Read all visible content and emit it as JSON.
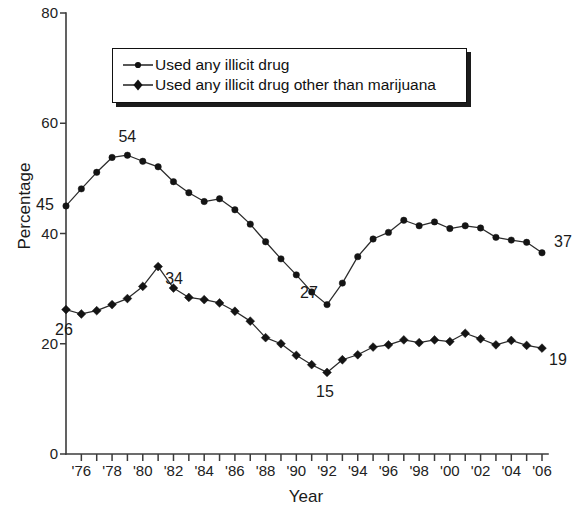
{
  "chart_data": {
    "type": "line",
    "title": "",
    "xlabel": "Year",
    "ylabel": "Percentage",
    "ylim": [
      0,
      80
    ],
    "yticks": [
      0,
      20,
      40,
      60,
      80
    ],
    "xlim": [
      1975,
      2006
    ],
    "xtick_values": [
      1976,
      1978,
      1980,
      1982,
      1984,
      1986,
      1988,
      1990,
      1992,
      1994,
      1996,
      1998,
      2000,
      2002,
      2004,
      2006
    ],
    "xtick_labels": [
      "'76",
      "'78",
      "'80",
      "'82",
      "'84",
      "'86",
      "'88",
      "'90",
      "'92",
      "'94",
      "'96",
      "'98",
      "'00",
      "'02",
      "'04",
      "'06"
    ],
    "minor_tick_every": 1,
    "grid": false,
    "legend_position": "upper-center",
    "x": [
      1975,
      1976,
      1977,
      1978,
      1979,
      1980,
      1981,
      1982,
      1983,
      1984,
      1985,
      1986,
      1987,
      1988,
      1989,
      1990,
      1991,
      1992,
      1993,
      1994,
      1995,
      1996,
      1997,
      1998,
      1999,
      2000,
      2001,
      2002,
      2003,
      2004,
      2005,
      2006
    ],
    "series": [
      {
        "name": "Used any illicit drug",
        "marker": "circle",
        "values": [
          45.0,
          48.1,
          51.1,
          53.8,
          54.2,
          53.1,
          52.1,
          49.4,
          47.4,
          45.8,
          46.3,
          44.3,
          41.7,
          38.5,
          35.4,
          32.5,
          29.4,
          27.1,
          31.0,
          35.8,
          39.0,
          40.2,
          42.4,
          41.4,
          42.1,
          40.9,
          41.4,
          41.0,
          39.3,
          38.8,
          38.4,
          36.5
        ]
      },
      {
        "name": "Used any illicit drug other than marijuana",
        "marker": "diamond",
        "values": [
          26.2,
          25.4,
          26.0,
          27.1,
          28.2,
          30.4,
          34.0,
          30.1,
          28.4,
          28.0,
          27.4,
          25.9,
          24.1,
          21.1,
          20.0,
          17.9,
          16.2,
          14.8,
          17.1,
          18.0,
          19.4,
          19.8,
          20.7,
          20.2,
          20.7,
          20.4,
          21.9,
          20.9,
          19.8,
          20.6,
          19.7,
          19.2
        ]
      }
    ],
    "annotations": [
      {
        "text": "45",
        "x": 1975,
        "y": 45.0,
        "series": 0,
        "position": "left"
      },
      {
        "text": "54",
        "x": 1979,
        "y": 54.2,
        "series": 0,
        "position": "above"
      },
      {
        "text": "27",
        "x": 1992,
        "y": 27.1,
        "series": 0,
        "position": "upper-left"
      },
      {
        "text": "37",
        "x": 2006,
        "y": 36.5,
        "series": 0,
        "position": "upper-right"
      },
      {
        "text": "26",
        "x": 1975,
        "y": 26.2,
        "series": 1,
        "position": "below"
      },
      {
        "text": "34",
        "x": 1981,
        "y": 34.0,
        "series": 1,
        "position": "lower-right"
      },
      {
        "text": "15",
        "x": 1992,
        "y": 14.8,
        "series": 1,
        "position": "below"
      },
      {
        "text": "19",
        "x": 2006,
        "y": 19.2,
        "series": 1,
        "position": "lower-right"
      }
    ]
  },
  "axes": {
    "y_title": "Percentage",
    "x_title": "Year",
    "y_tick_labels": [
      "0",
      "20",
      "40",
      "60",
      "80"
    ],
    "x_tick_labels": [
      "'76",
      "'78",
      "'80",
      "'82",
      "'84",
      "'86",
      "'88",
      "'90",
      "'92",
      "'94",
      "'96",
      "'98",
      "'00",
      "'02",
      "'04",
      "'06"
    ]
  },
  "legend": {
    "entries": [
      {
        "label": "Used any illicit drug",
        "marker": "circle-marker"
      },
      {
        "label": "Used any illicit drug other than marijuana",
        "marker": "diamond-marker"
      }
    ]
  },
  "annotation_labels": {
    "a45": "45",
    "a54": "54",
    "a27": "27",
    "a37": "37",
    "a26": "26",
    "a34": "34",
    "a15": "15",
    "a19": "19"
  },
  "colors": {
    "line": "#2b2b2b",
    "marker": "#141414",
    "axis": "#3b3b3b",
    "text": "#1a1a1a",
    "background": "#ffffff"
  }
}
